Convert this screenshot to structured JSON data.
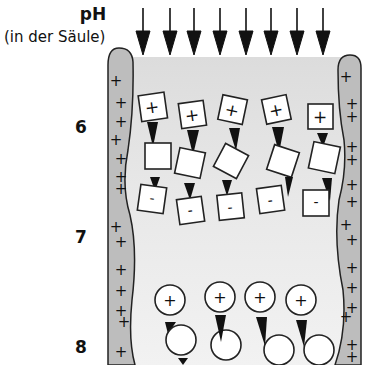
{
  "axis": {
    "title": "pH",
    "subtitle": "(in der Säule)",
    "ph_levels": [
      {
        "value": "6",
        "y": 128
      },
      {
        "value": "7",
        "y": 238
      },
      {
        "value": "8",
        "y": 348
      }
    ]
  },
  "column": {
    "wall_color": "#bdbdbd",
    "interior_color": "#e6e6e6",
    "wall_charge_symbol": "+",
    "flow_arrows": 7
  },
  "molecules": {
    "square_group": {
      "charges": [
        "+",
        "",
        "-"
      ],
      "count": 5,
      "description": "protein migrating: positively charged, neutral, negatively charged"
    },
    "circle_group": {
      "charges": [
        "+",
        ""
      ],
      "count": 4,
      "description": "protein migrating: positively charged, neutral"
    }
  },
  "colors": {
    "stroke": "#222222",
    "arrow": "#111111",
    "molecule_fill": "#ffffff"
  }
}
